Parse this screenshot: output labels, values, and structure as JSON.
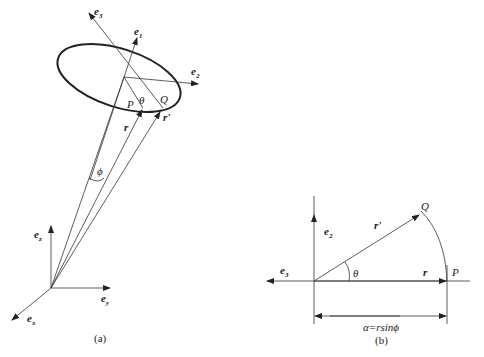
{
  "figure_a": {
    "caption": "(a)",
    "labels": {
      "e3": "e",
      "e3_sub": "3",
      "e1": "e",
      "e1_sub": "1",
      "e2": "e",
      "e2_sub": "2",
      "P": "P",
      "Q": "Q",
      "theta": "θ",
      "r": "r",
      "r_prime": "r'",
      "phi": "ϕ",
      "ez": "e",
      "ez_sub": "z",
      "ey": "e",
      "ey_sub": "y",
      "ex": "e",
      "ex_sub": "x"
    }
  },
  "figure_b": {
    "caption": "(b)",
    "labels": {
      "e2": "e",
      "e2_sub": "2",
      "e3": "e",
      "e3_sub": "3",
      "Q": "Q",
      "r_prime": "r'",
      "theta": "θ",
      "r": "r",
      "P": "P",
      "alpha_eq": "α=rsinϕ"
    }
  },
  "colors": {
    "line": "#333333",
    "text": "#222222",
    "background": "#ffffff"
  }
}
